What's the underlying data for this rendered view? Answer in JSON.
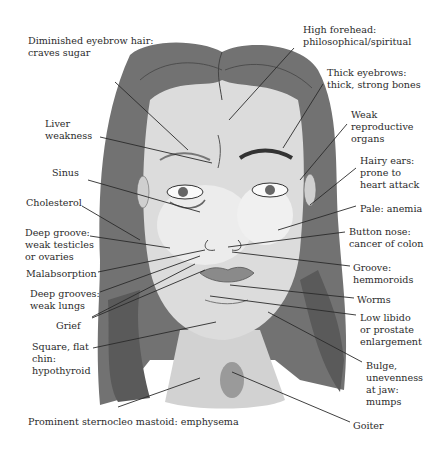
{
  "diagram": {
    "labels": [
      {
        "id": "diminished-eyebrow",
        "text": "Diminished eyebrow hair:\ncraves sugar",
        "x": 28,
        "y": 35
      },
      {
        "id": "high-forehead",
        "text": "High forehead:\nphilosophical/spiritual",
        "x": 303,
        "y": 24
      },
      {
        "id": "thick-eyebrows",
        "text": "Thick eyebrows:\nthick, strong bones",
        "x": 327,
        "y": 67
      },
      {
        "id": "liver-weakness",
        "text": "Liver\nweakness",
        "x": 45,
        "y": 118
      },
      {
        "id": "weak-reproductive",
        "text": "Weak\nreproductive\norgans",
        "x": 351,
        "y": 109
      },
      {
        "id": "hairy-ears",
        "text": "Hairy ears:\nprone to\nheart attack",
        "x": 360,
        "y": 155
      },
      {
        "id": "sinus",
        "text": "Sinus",
        "x": 52,
        "y": 167
      },
      {
        "id": "cholesterol",
        "text": "Cholesterol",
        "x": 26,
        "y": 197
      },
      {
        "id": "pale",
        "text": "Pale: anemia",
        "x": 360,
        "y": 203
      },
      {
        "id": "deep-groove-testicles",
        "text": "Deep groove:\nweak testicles\nor ovaries",
        "x": 25,
        "y": 227
      },
      {
        "id": "button-nose",
        "text": "Button nose:\ncancer of colon",
        "x": 349,
        "y": 226
      },
      {
        "id": "malabsorption",
        "text": "Malabsorption",
        "x": 26,
        "y": 268
      },
      {
        "id": "groove-hemmoroids",
        "text": "Groove:\nhemmoroids",
        "x": 353,
        "y": 262
      },
      {
        "id": "deep-grooves-lungs",
        "text": "Deep grooves:\nweak lungs",
        "x": 30,
        "y": 288
      },
      {
        "id": "worms",
        "text": "Worms",
        "x": 357,
        "y": 294
      },
      {
        "id": "low-libido",
        "text": "Low libido\nor prostate\nenlargement",
        "x": 360,
        "y": 312
      },
      {
        "id": "grief",
        "text": "Grief",
        "x": 56,
        "y": 320
      },
      {
        "id": "square-chin",
        "text": "Square, flat\nchin:\nhypothyroid",
        "x": 32,
        "y": 341
      },
      {
        "id": "bulge-jaw",
        "text": "Bulge,\nunevenness\nat jaw:\nmumps",
        "x": 366,
        "y": 360
      },
      {
        "id": "sternocleo",
        "text": "Prominent sternocleo mastoid: emphysema",
        "x": 28,
        "y": 416
      },
      {
        "id": "goiter",
        "text": "Goiter",
        "x": 353,
        "y": 420
      }
    ],
    "colors": {
      "background": "#ffffff",
      "text": "#2b2b2b",
      "hair": "#6e6e6e",
      "hair_dark": "#4e4e4e",
      "skin": "#d9d9d9",
      "skin_light": "#ededed",
      "lines": "#2a2a2a"
    }
  }
}
